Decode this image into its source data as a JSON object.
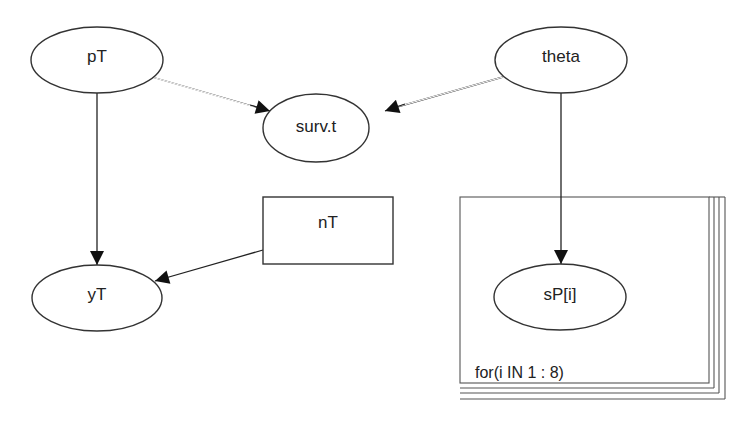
{
  "diagram": {
    "type": "directed graphical model (DAG)",
    "nodes": [
      {
        "id": "pT",
        "label": "pT",
        "shape": "ellipse",
        "kind": "stochastic"
      },
      {
        "id": "theta",
        "label": "theta",
        "shape": "ellipse",
        "kind": "stochastic"
      },
      {
        "id": "surv_t",
        "label": "surv.t",
        "shape": "ellipse",
        "kind": "stochastic"
      },
      {
        "id": "nT",
        "label": "nT",
        "shape": "rectangle",
        "kind": "constant"
      },
      {
        "id": "yT",
        "label": "yT",
        "shape": "ellipse",
        "kind": "stochastic"
      },
      {
        "id": "sP_i",
        "label": "sP[i]",
        "shape": "ellipse",
        "kind": "stochastic"
      }
    ],
    "edges": [
      {
        "from": "pT",
        "to": "surv_t",
        "style": "double"
      },
      {
        "from": "theta",
        "to": "surv_t",
        "style": "double"
      },
      {
        "from": "pT",
        "to": "yT",
        "style": "single"
      },
      {
        "from": "nT",
        "to": "yT",
        "style": "single"
      },
      {
        "from": "theta",
        "to": "sP_i",
        "style": "single"
      }
    ],
    "plate": {
      "label": "for(i IN 1 : 8)",
      "contains": [
        "sP_i"
      ]
    }
  },
  "colors": {
    "background": "#ffffff",
    "stroke": "#333333",
    "text": "#222222"
  }
}
